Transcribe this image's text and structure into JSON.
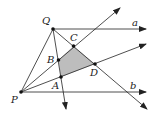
{
  "diagram": {
    "type": "geometry",
    "points": {
      "Q": {
        "label": "Q",
        "x": 53,
        "y": 29
      },
      "C": {
        "label": "C",
        "x": 73.5,
        "y": 46
      },
      "B": {
        "label": "B",
        "x": 58.5,
        "y": 60
      },
      "D": {
        "label": "D",
        "x": 95,
        "y": 64
      },
      "A": {
        "label": "A",
        "x": 61,
        "y": 77
      },
      "P": {
        "label": "P",
        "x": 21,
        "y": 92
      }
    },
    "lines": {
      "a": {
        "label": "a"
      },
      "b": {
        "label": "b"
      }
    },
    "shaded_region": "ABCD",
    "colors": {
      "line": "#222222",
      "fill": "#bdbdbd"
    }
  }
}
